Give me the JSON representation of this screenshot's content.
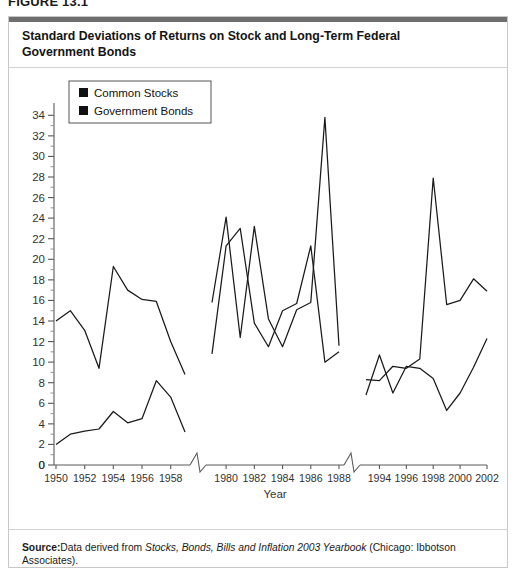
{
  "figure": {
    "label": "FIGURE 13.1",
    "title": "Standard Deviations of Returns on Stock and Long-Term Federal Government Bonds",
    "source_prefix": "Source:",
    "source_body_1": "Data derived from ",
    "source_italic": "Stocks, Bonds, Bills and Inflation 2003 Yearbook",
    "source_body_2": " (Chicago: Ibbotson Associates)."
  },
  "chart_data": {
    "type": "line",
    "title": "Standard Deviations of Returns on Stock and Long-Term Federal Government Bonds",
    "xlabel": "Year",
    "ylabel": "",
    "ylim": [
      0,
      35
    ],
    "yticks": [
      0,
      2,
      4,
      6,
      8,
      10,
      12,
      14,
      16,
      18,
      20,
      22,
      24,
      26,
      28,
      30,
      32,
      34
    ],
    "yminor_ticks": [
      1,
      3,
      5,
      7,
      9,
      11,
      13,
      15,
      17,
      19,
      21,
      23,
      25,
      27,
      29,
      31,
      33
    ],
    "grid": false,
    "legend_position": "top-left",
    "axis_breaks": 2,
    "x_segments": [
      {
        "name": "segment-1950s",
        "xticks": [
          1950,
          1952,
          1954,
          1956,
          1958
        ],
        "years": [
          1950,
          1951,
          1952,
          1953,
          1954,
          1955,
          1956,
          1957,
          1958,
          1959
        ],
        "series": [
          {
            "name": "Common Stocks",
            "values": [
              14.0,
              15.0,
              13.1,
              9.4,
              19.3,
              17.0,
              16.1,
              15.9,
              12.0,
              8.8
            ]
          },
          {
            "name": "Government Bonds",
            "values": [
              2.0,
              3.0,
              3.3,
              3.5,
              5.2,
              4.1,
              4.5,
              8.2,
              6.6,
              3.2
            ]
          }
        ]
      },
      {
        "name": "segment-1980s",
        "xticks": [
          1980,
          1982,
          1984,
          1986,
          1988
        ],
        "years": [
          1979,
          1980,
          1981,
          1982,
          1983,
          1984,
          1985,
          1986,
          1987,
          1988
        ],
        "series": [
          {
            "name": "Common Stocks",
            "values": [
              15.8,
              24.1,
              12.4,
              23.2,
              14.2,
              11.5,
              15.1,
              15.8,
              33.8,
              11.6
            ]
          },
          {
            "name": "Government Bonds",
            "values": [
              10.8,
              21.3,
              23.0,
              13.8,
              11.5,
              15.0,
              15.7,
              21.3,
              10.0,
              11.0
            ]
          }
        ]
      },
      {
        "name": "segment-1990s-2000s",
        "xticks": [
          1994,
          1996,
          1998,
          2000,
          2002
        ],
        "years": [
          1993,
          1994,
          1995,
          1996,
          1997,
          1998,
          1999,
          2000,
          2001,
          2002
        ],
        "series": [
          {
            "name": "Common Stocks",
            "values": [
              8.3,
              8.2,
              9.6,
              9.4,
              10.3,
              27.9,
              15.6,
              16.0,
              18.1,
              16.9
            ]
          },
          {
            "name": "Government Bonds",
            "values": [
              6.8,
              10.7,
              7.0,
              9.6,
              9.4,
              8.4,
              5.3,
              7.0,
              9.5,
              12.3
            ]
          }
        ]
      }
    ],
    "legend": [
      {
        "label": "Common Stocks",
        "marker": "filled-square",
        "color": "#111111"
      },
      {
        "label": "Government Bonds",
        "marker": "filled-square",
        "color": "#111111"
      }
    ]
  }
}
